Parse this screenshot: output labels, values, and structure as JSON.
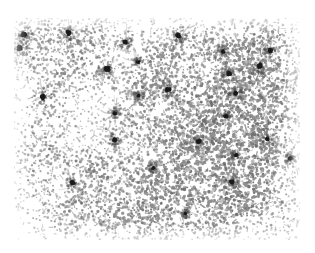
{
  "figure": {
    "kind": "micrograph",
    "caption": "",
    "title": "",
    "background_color": "#ffffff"
  },
  "image_region": {
    "x": 14,
    "y": 18,
    "width": 286,
    "height": 222,
    "border": "none"
  },
  "rendering": {
    "paper_color": "#ffffff",
    "stipple_color": "#8c8c8c",
    "stipple_color_dark": "#6e6e6e",
    "stipple_color_light": "#b9b9b9",
    "nucleus_color": "#1a1a1a",
    "nucleus_halo_color": "#4a4a4a",
    "stipple_count": 9000,
    "stipple_min_radius": 0.55,
    "stipple_max_radius": 1.45,
    "vignette_edge_fade": 0.12,
    "noise_seed": 20240517
  },
  "texture_fields": {
    "description": "Low-frequency density field producing mottled light and dark patches in the stipple",
    "blobs": [
      {
        "cx": 0.1,
        "cy": 0.12,
        "r": 0.3,
        "amp": 0.34
      },
      {
        "cx": 0.4,
        "cy": 0.08,
        "r": 0.26,
        "amp": -0.22
      },
      {
        "cx": 0.72,
        "cy": 0.14,
        "r": 0.3,
        "amp": 0.3
      },
      {
        "cx": 0.94,
        "cy": 0.22,
        "r": 0.24,
        "amp": 0.26
      },
      {
        "cx": 0.18,
        "cy": 0.36,
        "r": 0.24,
        "amp": -0.26
      },
      {
        "cx": 0.52,
        "cy": 0.33,
        "r": 0.3,
        "amp": 0.24
      },
      {
        "cx": 0.86,
        "cy": 0.4,
        "r": 0.26,
        "amp": 0.28
      },
      {
        "cx": 0.08,
        "cy": 0.56,
        "r": 0.26,
        "amp": 0.22
      },
      {
        "cx": 0.33,
        "cy": 0.54,
        "r": 0.24,
        "amp": -0.3
      },
      {
        "cx": 0.62,
        "cy": 0.58,
        "r": 0.28,
        "amp": 0.26
      },
      {
        "cx": 0.9,
        "cy": 0.64,
        "r": 0.24,
        "amp": 0.2
      },
      {
        "cx": 0.16,
        "cy": 0.78,
        "r": 0.28,
        "amp": -0.24
      },
      {
        "cx": 0.46,
        "cy": 0.82,
        "r": 0.3,
        "amp": 0.26
      },
      {
        "cx": 0.76,
        "cy": 0.86,
        "r": 0.26,
        "amp": 0.22
      },
      {
        "cx": 0.28,
        "cy": 0.94,
        "r": 0.22,
        "amp": 0.18
      },
      {
        "cx": 0.66,
        "cy": 0.24,
        "r": 0.18,
        "amp": -0.2
      },
      {
        "cx": 0.24,
        "cy": 0.66,
        "r": 0.2,
        "amp": 0.18
      }
    ]
  },
  "nuclei": {
    "description": "Dark stained nuclei / cell bodies visible as near-black clusters; coordinates are fractions of the image region",
    "count": 26,
    "points": [
      {
        "id": "n1",
        "x": 0.035,
        "y": 0.075,
        "size": 1.25,
        "intensity": 0.95
      },
      {
        "id": "n2",
        "x": 0.02,
        "y": 0.135,
        "size": 1.55,
        "intensity": 1.0
      },
      {
        "id": "n3",
        "x": 0.19,
        "y": 0.068,
        "size": 1.2,
        "intensity": 0.92
      },
      {
        "id": "n4",
        "x": 0.39,
        "y": 0.108,
        "size": 1.05,
        "intensity": 0.88
      },
      {
        "id": "n5",
        "x": 0.575,
        "y": 0.082,
        "size": 1.2,
        "intensity": 0.93
      },
      {
        "id": "n6",
        "x": 0.73,
        "y": 0.15,
        "size": 1.0,
        "intensity": 0.86
      },
      {
        "id": "n7",
        "x": 0.895,
        "y": 0.148,
        "size": 1.05,
        "intensity": 0.88
      },
      {
        "id": "n8",
        "x": 0.86,
        "y": 0.215,
        "size": 1.25,
        "intensity": 0.94
      },
      {
        "id": "n9",
        "x": 0.325,
        "y": 0.23,
        "size": 1.45,
        "intensity": 0.9
      },
      {
        "id": "n10",
        "x": 0.435,
        "y": 0.198,
        "size": 0.95,
        "intensity": 0.84
      },
      {
        "id": "n11",
        "x": 0.75,
        "y": 0.252,
        "size": 1.1,
        "intensity": 0.92
      },
      {
        "id": "n12",
        "x": 0.1,
        "y": 0.355,
        "size": 1.45,
        "intensity": 0.93
      },
      {
        "id": "n13",
        "x": 0.54,
        "y": 0.322,
        "size": 1.25,
        "intensity": 0.95
      },
      {
        "id": "n14",
        "x": 0.435,
        "y": 0.35,
        "size": 0.9,
        "intensity": 0.82
      },
      {
        "id": "n15",
        "x": 0.775,
        "y": 0.338,
        "size": 1.1,
        "intensity": 0.88
      },
      {
        "id": "n16",
        "x": 0.352,
        "y": 0.43,
        "size": 0.95,
        "intensity": 0.8
      },
      {
        "id": "n17",
        "x": 0.74,
        "y": 0.443,
        "size": 1.05,
        "intensity": 0.86
      },
      {
        "id": "n18",
        "x": 0.352,
        "y": 0.548,
        "size": 1.25,
        "intensity": 0.94
      },
      {
        "id": "n19",
        "x": 0.645,
        "y": 0.557,
        "size": 1.1,
        "intensity": 0.9
      },
      {
        "id": "n20",
        "x": 0.885,
        "y": 0.545,
        "size": 1.05,
        "intensity": 0.88
      },
      {
        "id": "n21",
        "x": 0.775,
        "y": 0.618,
        "size": 0.95,
        "intensity": 0.84
      },
      {
        "id": "n22",
        "x": 0.965,
        "y": 0.632,
        "size": 0.95,
        "intensity": 0.82
      },
      {
        "id": "n23",
        "x": 0.205,
        "y": 0.742,
        "size": 1.05,
        "intensity": 0.88
      },
      {
        "id": "n24",
        "x": 0.762,
        "y": 0.738,
        "size": 1.2,
        "intensity": 0.92
      },
      {
        "id": "n25",
        "x": 0.487,
        "y": 0.675,
        "size": 0.85,
        "intensity": 0.78
      },
      {
        "id": "n26",
        "x": 0.6,
        "y": 0.88,
        "size": 0.8,
        "intensity": 0.74
      }
    ]
  },
  "filaments": {
    "description": "Faint branching processes radiating from some nuclei, drawn as thin gray strands",
    "color": "#9a9a9a",
    "strands_per_nucleus": 5,
    "max_length": 0.065
  }
}
